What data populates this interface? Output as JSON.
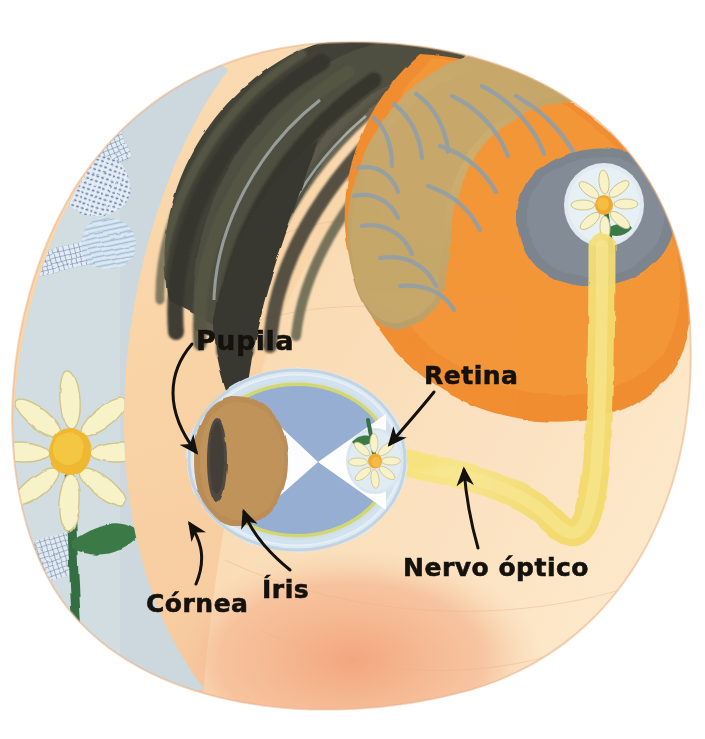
{
  "illustration": {
    "title": "Corte transversal da cabeça humana mostrando o olho, o nervo óptico e o córtex visual",
    "subject": "anatomia-da-visao",
    "language": "pt-BR",
    "style": "ilustração pintada em guache"
  },
  "labels": [
    {
      "id": "pupila",
      "text": "Pupila",
      "points_to": "pupil",
      "x": 196,
      "y": 325
    },
    {
      "id": "retina",
      "text": "Retina",
      "points_to": "retina",
      "x": 424,
      "y": 361
    },
    {
      "id": "nervo",
      "text": "Nervo óptico",
      "points_to": "optic-nerve",
      "x": 403,
      "y": 553
    },
    {
      "id": "cornea",
      "text": "Córnea",
      "points_to": "cornea",
      "x": 146,
      "y": 589
    },
    {
      "id": "iris",
      "text": "Íris",
      "points_to": "iris",
      "x": 262,
      "y": 575
    }
  ],
  "parts": [
    {
      "id": "head",
      "name": "Cabeça (perfil)"
    },
    {
      "id": "hair",
      "name": "Cabelo"
    },
    {
      "id": "brain",
      "name": "Cérebro"
    },
    {
      "id": "visual-cortex",
      "name": "Córtex visual"
    },
    {
      "id": "eyeball",
      "name": "Globo ocular"
    },
    {
      "id": "cornea",
      "name": "Córnea"
    },
    {
      "id": "iris",
      "name": "Íris"
    },
    {
      "id": "pupil",
      "name": "Pupila"
    },
    {
      "id": "retina",
      "name": "Retina"
    },
    {
      "id": "optic-nerve",
      "name": "Nervo óptico"
    },
    {
      "id": "flower-object",
      "name": "Flor (objeto observado)"
    },
    {
      "id": "flower-retina",
      "name": "Imagem invertida na retina"
    },
    {
      "id": "flower-cortex",
      "name": "Imagem corrigida no córtex"
    },
    {
      "id": "light-rays",
      "name": "Raios de luz"
    },
    {
      "id": "background",
      "name": "Fundo azul-acinzentado texturizado"
    }
  ],
  "colors": {
    "background_page": "#ffffff",
    "backdrop_blue_grey": "#c3d2d8",
    "skin": "#f8d3a8",
    "skin_shadow": "#f0a074",
    "skin_light": "#fbe0bc",
    "hair_dark": "#3a3a30",
    "hair_olive": "#4e5040",
    "brain_orange": "#f08a2a",
    "brain_olive": "#c9a866",
    "brain_sulci": "#8d9aa0",
    "cortex_grey": "#77808a",
    "sclera_pale": "#dde9f2",
    "eye_blue": "#8fa8d4",
    "eye_rim_yellow": "#d6d868",
    "iris_brown": "#b98a50",
    "pupil_dark": "#4a453c",
    "light_cone_white": "#ffffff",
    "optic_nerve_yellow": "#f7e06a",
    "petal_cream": "#f8f2c8",
    "flower_center": "#f0a82a",
    "stem_green": "#2e6b3c",
    "label_text": "#15110c",
    "leader_line": "#14100b"
  }
}
